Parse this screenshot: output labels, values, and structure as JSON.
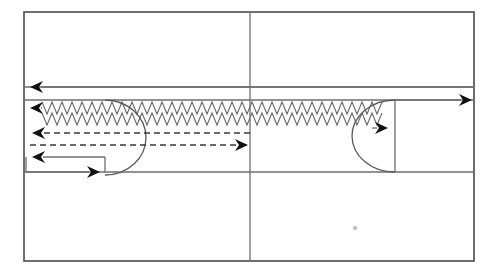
{
  "figure": {
    "title": "",
    "type": "schematic-flow-diagram",
    "background_color": "#ffffff",
    "line_color": "#6e6e6e",
    "frame_color": "#4a4a4a",
    "arrowhead_color": "#111111",
    "dashed_color": "#3a3a3a",
    "zigzag_color": "#6b6b6b"
  },
  "outer_frame": {
    "name": "outer-frame",
    "x": 24,
    "y": 12,
    "width": 450,
    "height": 249
  },
  "dividers": [
    {
      "name": "vertical-divider",
      "orientation": "vertical",
      "x": 250,
      "y1": 12,
      "y2": 261
    },
    {
      "name": "upper-band-top-rule",
      "orientation": "horizontal",
      "y": 87,
      "x1": 24,
      "x2": 474
    },
    {
      "name": "upper-band-bottom-rule",
      "orientation": "horizontal",
      "y": 100,
      "x1": 24,
      "x2": 474
    },
    {
      "name": "lower-band-rule",
      "orientation": "horizontal",
      "y": 172,
      "x1": 24,
      "x2": 474
    },
    {
      "name": "right-chamber-left-wall",
      "orientation": "vertical",
      "x": 395,
      "y1": 100,
      "y2": 172
    }
  ],
  "flows": [
    {
      "name": "top-return-flow",
      "direction": "left",
      "style": "solid",
      "y": 87,
      "x_start": 474,
      "x_end": 30,
      "arrowhead": "left"
    },
    {
      "name": "outlet-flow",
      "direction": "right",
      "style": "solid",
      "y": 100,
      "x_start": 395,
      "x_end": 472,
      "arrowhead": "right"
    },
    {
      "name": "upper-dashed-return-flow",
      "direction": "left",
      "style": "dashed",
      "y": 133,
      "x_start": 250,
      "x_end": 32,
      "arrowhead": "left"
    },
    {
      "name": "lower-dashed-forward-flow",
      "direction": "right",
      "style": "dashed",
      "y": 145,
      "x_start": 30,
      "x_end": 248,
      "arrowhead": "right"
    },
    {
      "name": "bottom-loop-return-flow",
      "direction": "left",
      "style": "solid",
      "y": 157,
      "x_start": 105,
      "x_end": 32,
      "arrowhead": "left"
    },
    {
      "name": "bottom-loop-forward-flow",
      "direction": "right",
      "style": "solid",
      "y": 172,
      "x_start": 26,
      "x_end": 100,
      "arrowhead": "right"
    },
    {
      "name": "upper-left-inlet-arrowhead",
      "direction": "left",
      "style": "solid",
      "y": 108,
      "x_start": 42,
      "x_end": 30,
      "arrowhead": "left"
    },
    {
      "name": "right-chamber-inlet-arrowhead",
      "direction": "right",
      "style": "solid",
      "y": 128,
      "x_start": 372,
      "x_end": 388,
      "arrowhead": "right"
    }
  ],
  "arcs": [
    {
      "name": "left-recirculation-arc",
      "center_x": 105,
      "top_y": 100,
      "bottom_y": 175,
      "bulge_x": 146,
      "description": "semicircular recirculation path bulging right"
    },
    {
      "name": "right-recirculation-arc",
      "center_x": 395,
      "top_y": 100,
      "bottom_y": 172,
      "bulge_x": 352,
      "description": "semicircular recirculation path bulging left"
    }
  ],
  "zigzag_bands": [
    {
      "name": "zigzag-band-upper",
      "y_top": 102,
      "y_bottom": 114,
      "x_start": 42,
      "x_end": 382,
      "tooth_width": 10,
      "teeth": 34
    },
    {
      "name": "zigzag-band-lower",
      "y_top": 113,
      "y_bottom": 125,
      "x_start": 42,
      "x_end": 382,
      "tooth_width": 10,
      "teeth": 34
    }
  ],
  "marks": [
    {
      "name": "speck-mark",
      "x": 355,
      "y": 228,
      "size": 2
    }
  ],
  "labels": []
}
